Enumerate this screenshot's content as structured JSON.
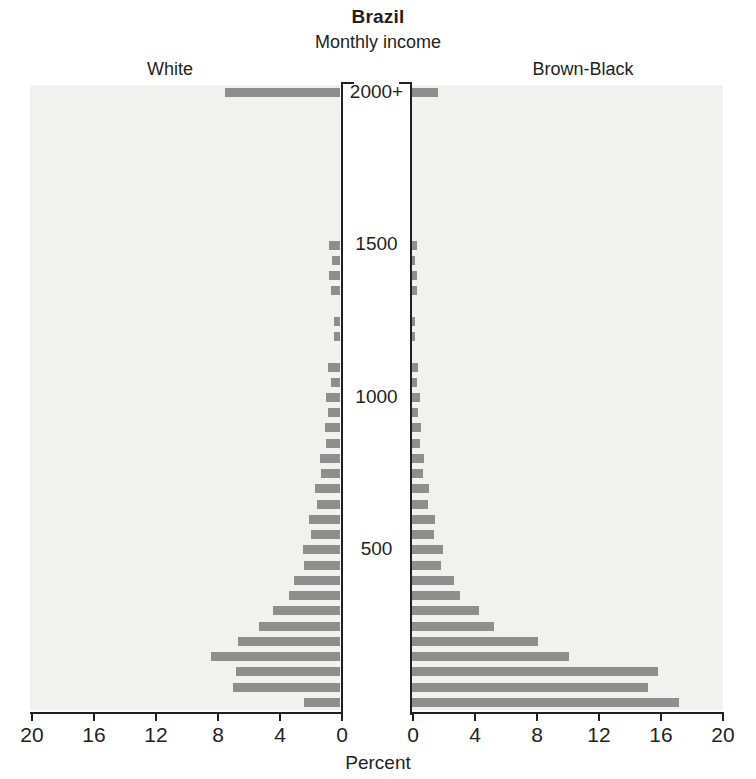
{
  "header": {
    "title": "Brazil",
    "subtitle": "Monthly income",
    "left_group": "White",
    "right_group": "Brown-Black"
  },
  "axis": {
    "x_title": "Percent",
    "x_ticks_left": [
      "20",
      "16",
      "12",
      "8",
      "4",
      "0"
    ],
    "x_ticks_right": [
      "0",
      "4",
      "8",
      "12",
      "16",
      "20"
    ],
    "x_max": 20,
    "y_ticks": [
      "2000+",
      "1500",
      "1000",
      "500"
    ]
  },
  "colors": {
    "bar": "#8e8e8e",
    "panel_background": "#f1f1f0",
    "axis": "#231f20",
    "text": "#231f20"
  },
  "chart_data": {
    "type": "bar",
    "title": "Brazil",
    "subtitle": "Monthly income",
    "xlabel": "Percent",
    "ylabel": "Monthly income",
    "xlim": [
      0,
      20
    ],
    "grid": false,
    "legend": "none",
    "orientation": "horizontal",
    "layout": "population-pyramid",
    "categories": [
      "2000+",
      "1950",
      "1900",
      "1850",
      "1800",
      "1750",
      "1700",
      "1650",
      "1600",
      "1550",
      "1500",
      "1450",
      "1400",
      "1350",
      "1300",
      "1250",
      "1200",
      "1150",
      "1100",
      "1050",
      "1000",
      "950",
      "900",
      "850",
      "800",
      "750",
      "700",
      "650",
      "600",
      "550",
      "500",
      "450",
      "400",
      "350",
      "300",
      "250",
      "200",
      "150",
      "100",
      "50",
      "0"
    ],
    "series": [
      {
        "name": "White",
        "side": "left",
        "values": [
          7.4,
          0.0,
          0.0,
          0.0,
          0.0,
          0.0,
          0.0,
          0.0,
          0.0,
          0.0,
          0.7,
          0.5,
          0.7,
          0.6,
          0.0,
          0.4,
          0.4,
          0.0,
          0.8,
          0.6,
          0.9,
          0.8,
          1.0,
          0.9,
          1.3,
          1.2,
          1.6,
          1.5,
          2.0,
          1.9,
          2.4,
          2.3,
          3.0,
          3.3,
          4.3,
          5.2,
          6.6,
          8.3,
          6.7,
          6.9,
          2.3
        ]
      },
      {
        "name": "Brown-Black",
        "side": "right",
        "values": [
          1.7,
          0.0,
          0.0,
          0.0,
          0.0,
          0.0,
          0.0,
          0.0,
          0.0,
          0.0,
          0.3,
          0.2,
          0.3,
          0.3,
          0.0,
          0.2,
          0.2,
          0.0,
          0.4,
          0.3,
          0.5,
          0.4,
          0.6,
          0.5,
          0.8,
          0.7,
          1.1,
          1.0,
          1.5,
          1.4,
          2.0,
          1.9,
          2.7,
          3.1,
          4.3,
          5.3,
          8.1,
          10.1,
          15.9,
          15.2,
          17.2
        ]
      }
    ]
  }
}
